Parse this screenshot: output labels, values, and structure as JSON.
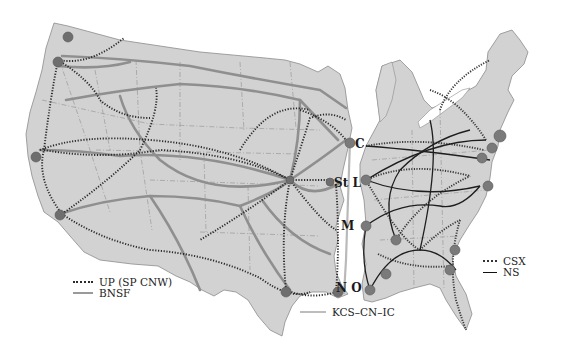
{
  "map": {
    "title": "",
    "regions": [
      "western-us",
      "eastern-us"
    ],
    "city_labels": [
      {
        "id": "chicago",
        "label": "C",
        "x": 355,
        "y": 148
      },
      {
        "id": "st-louis",
        "label": "St L",
        "x": 334,
        "y": 187
      },
      {
        "id": "memphis",
        "label": "M",
        "x": 341,
        "y": 230
      },
      {
        "id": "new-orleans",
        "label": "N O",
        "x": 336,
        "y": 292
      }
    ],
    "colors": {
      "land": "#d2d2d2",
      "up_line": "#2a2a2a",
      "bnsf_line": "#8f8f8f",
      "kcs_line": "#b9b9b9",
      "csx_line": "#3a3a3a",
      "ns_line": "#1e1e1e",
      "hub": "#6e6e6e"
    }
  },
  "legend_west": {
    "items": [
      {
        "label": "UP (SP CNW)",
        "style": "dotted"
      },
      {
        "label": "BNSF",
        "style": "solid-gray"
      }
    ]
  },
  "legend_central": {
    "items": [
      {
        "label": "KCS–CN–IC",
        "style": "solid-light-gray"
      }
    ]
  },
  "legend_east": {
    "items": [
      {
        "label": "CSX",
        "style": "dotted"
      },
      {
        "label": "NS",
        "style": "solid-black"
      }
    ]
  }
}
